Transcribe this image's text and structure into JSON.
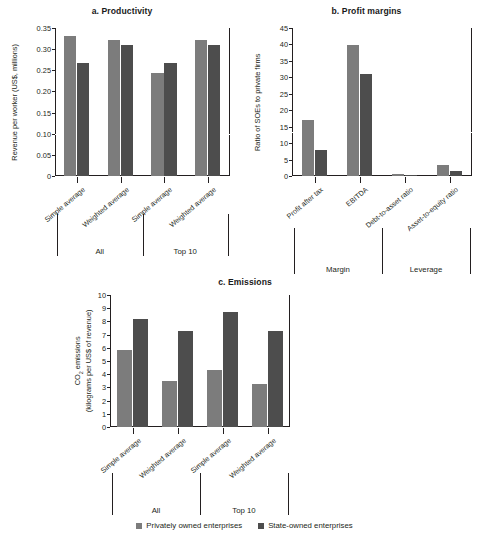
{
  "figure": {
    "background": "#ffffff",
    "colors": {
      "private": "#7c7c7c",
      "soe": "#4d4d4d",
      "axis": "#231f20"
    }
  },
  "legend": {
    "items": [
      {
        "label": "Privately owned enterprises",
        "color": "#7c7c7c",
        "key": "private"
      },
      {
        "label": "State-owned enterprises",
        "color": "#4d4d4d",
        "key": "soe"
      }
    ]
  },
  "chart_data": [
    {
      "type": "bar",
      "panel": "a",
      "title": "a. Productivity",
      "ylabel": "Revenue per worker (US$, millions)",
      "xlabel": "",
      "ylim": [
        0,
        0.35
      ],
      "yticks": [
        0,
        0.05,
        0.1,
        0.15,
        0.2,
        0.25,
        0.3,
        0.35
      ],
      "ytick_labels": [
        "0",
        "0.05",
        "0.10",
        "0.15",
        "0.20",
        "0.25",
        "0.30",
        "0.35"
      ],
      "grid": false,
      "legend_position": "bottom",
      "categories": [
        "Simple average",
        "Weighted average",
        "Simple average",
        "Weighted average"
      ],
      "groups": [
        {
          "label": "All",
          "categories": [
            0,
            1
          ]
        },
        {
          "label": "Top 10",
          "categories": [
            2,
            3
          ]
        }
      ],
      "series": [
        {
          "name": "Privately owned enterprises",
          "key": "private",
          "values": [
            0.332,
            0.322,
            0.244,
            0.322
          ]
        },
        {
          "name": "State-owned enterprises",
          "key": "soe",
          "values": [
            0.268,
            0.309,
            0.268,
            0.309
          ]
        }
      ]
    },
    {
      "type": "bar",
      "panel": "b",
      "title": "b. Profit margins",
      "ylabel": "Ratio of SOEs to private firms",
      "xlabel": "",
      "ylim": [
        0,
        45
      ],
      "yticks": [
        0,
        5,
        10,
        15,
        20,
        25,
        30,
        35,
        40,
        45
      ],
      "ytick_labels": [
        "0",
        "5",
        "10",
        "15",
        "20",
        "25",
        "30",
        "35",
        "40",
        "45"
      ],
      "grid": false,
      "legend_position": "bottom",
      "categories": [
        "Profit after tax",
        "EBITDA",
        "Debt-to-asset ratio",
        "Asset-to-equity ratio"
      ],
      "groups": [
        {
          "label": "Margin",
          "categories": [
            0,
            1
          ]
        },
        {
          "label": "Leverage",
          "categories": [
            2,
            3
          ]
        }
      ],
      "series": [
        {
          "name": "Privately owned enterprises",
          "key": "private",
          "values": [
            17.0,
            39.7,
            0.5,
            3.3
          ]
        },
        {
          "name": "State-owned enterprises",
          "key": "soe",
          "values": [
            8.0,
            31.0,
            0.4,
            1.6
          ]
        }
      ]
    },
    {
      "type": "bar",
      "panel": "c",
      "title": "c. Emissions",
      "ylabel": "CO2 emissions (kilograms per US$ of revenue)",
      "ylabel_line1": "CO",
      "ylabel_line1_sub": "2",
      "ylabel_line1_rest": " emissions",
      "ylabel_line2": "(kilograms per US$ of revenue)",
      "xlabel": "",
      "ylim": [
        0,
        10
      ],
      "yticks": [
        0,
        1,
        2,
        3,
        4,
        5,
        6,
        7,
        8,
        9,
        10
      ],
      "ytick_labels": [
        "0",
        "1",
        "2",
        "3",
        "4",
        "5",
        "6",
        "7",
        "8",
        "9",
        "10"
      ],
      "grid": false,
      "legend_position": "bottom",
      "categories": [
        "Simple average",
        "Weighted average",
        "Simple average",
        "Weighted average"
      ],
      "groups": [
        {
          "label": "All",
          "categories": [
            0,
            1
          ]
        },
        {
          "label": "Top 10",
          "categories": [
            2,
            3
          ]
        }
      ],
      "series": [
        {
          "name": "Privately owned enterprises",
          "key": "private",
          "values": [
            5.85,
            3.45,
            4.3,
            3.25
          ]
        },
        {
          "name": "State-owned enterprises",
          "key": "soe",
          "values": [
            8.2,
            7.25,
            8.7,
            7.3
          ]
        }
      ]
    }
  ]
}
